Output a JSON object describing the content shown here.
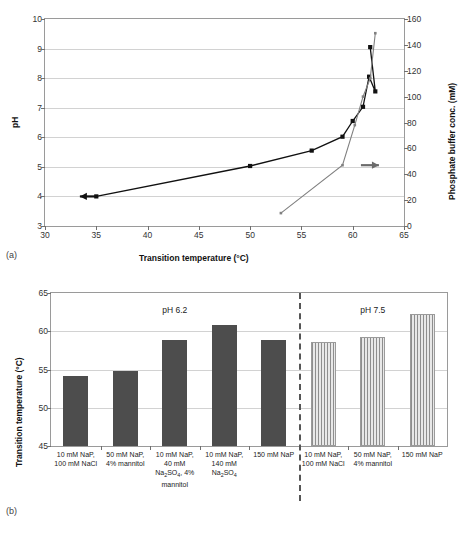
{
  "figure": {
    "panel_a_label": "(a)",
    "panel_b_label": "(b)"
  },
  "panel_a": {
    "x_axis_title": "Transition temperature (°C)",
    "y_left_title": "pH",
    "y_right_title": "Phosphate buffer conc. (mM)",
    "x_ticks": [
      "30",
      "35",
      "40",
      "45",
      "50",
      "55",
      "60",
      "65"
    ],
    "y_left_ticks": [
      "3",
      "4",
      "5",
      "6",
      "7",
      "8",
      "9",
      "10"
    ],
    "y_right_ticks": [
      "0",
      "20",
      "40",
      "60",
      "80",
      "100",
      "120",
      "140",
      "160"
    ],
    "left_arrow_icon": "left-arrow",
    "right_arrow_icon": "right-arrow"
  },
  "panel_b": {
    "y_axis_title": "Transition temperature (°C)",
    "y_ticks": [
      "45",
      "50",
      "55",
      "60",
      "65"
    ],
    "group_labels": [
      "pH 6.2",
      "pH 7.5"
    ]
  },
  "chart_data": [
    {
      "type": "line",
      "panel": "(a)",
      "title": "",
      "xlabel": "Transition temperature (°C)",
      "ylabel": "pH",
      "y2label": "Phosphate buffer conc. (mM)",
      "xlim": [
        30,
        65
      ],
      "ylim": [
        3,
        10
      ],
      "y2lim": [
        0,
        160
      ],
      "grid": true,
      "legend": "none",
      "annotations": [
        {
          "text": "left-arrow",
          "points_to": "pH series",
          "x": 33.4,
          "y": 4.0,
          "axis": "left"
        },
        {
          "text": "right-arrow",
          "points_to": "Phosphate buffer series",
          "x": 60.8,
          "y2": 47,
          "axis": "right"
        }
      ],
      "series": [
        {
          "name": "pH",
          "axis": "left",
          "color": "#111111",
          "marker": "square",
          "points": [
            {
              "x": 35.0,
              "y": 4.0
            },
            {
              "x": 50.0,
              "y": 5.03
            },
            {
              "x": 56.0,
              "y": 5.55
            },
            {
              "x": 59.0,
              "y": 6.02
            },
            {
              "x": 60.0,
              "y": 6.55
            },
            {
              "x": 61.0,
              "y": 7.03
            },
            {
              "x": 61.6,
              "y": 8.05
            },
            {
              "x": 62.2,
              "y": 7.55
            },
            {
              "x": 61.7,
              "y": 9.05
            }
          ]
        },
        {
          "name": "Phosphate buffer conc.",
          "axis": "right",
          "color": "#808080",
          "marker": "small-square",
          "points": [
            {
              "x": 53.0,
              "y2": 10
            },
            {
              "x": 59.0,
              "y2": 47
            },
            {
              "x": 60.2,
              "y2": 78
            },
            {
              "x": 61.0,
              "y2": 100
            },
            {
              "x": 61.7,
              "y2": 114
            },
            {
              "x": 62.2,
              "y2": 149
            }
          ]
        }
      ]
    },
    {
      "type": "bar",
      "panel": "(b)",
      "title": "",
      "xlabel": "",
      "ylabel": "Transition temperature (°C)",
      "ylim": [
        45,
        65
      ],
      "grid": true,
      "groups": [
        "pH 6.2",
        "pH 7.5"
      ],
      "categories": [
        "10 mM NaP, 100 mM NaCl",
        "50 mM NaP, 4% mannitol",
        "10 mM NaP, 40 mM Na2SO4, 4% mannitol",
        "10 mM NaP, 140 mM Na2SO4",
        "150 mM NaP",
        "10 mM NaP, 100 mM NaCl",
        "50 mM NaP, 4% mannitol",
        "150 mM NaP"
      ],
      "bars": [
        {
          "label_lines": [
            "10 mM NaP,",
            "100 mM NaCl"
          ],
          "value": 54.2,
          "group": "pH 6.2",
          "style": "solid"
        },
        {
          "label_lines": [
            "50 mM NaP,",
            "4% mannitol"
          ],
          "value": 54.8,
          "group": "pH 6.2",
          "style": "solid"
        },
        {
          "label_lines": [
            "10 mM NaP,",
            "40 mM",
            "Na<sub>2</sub>SO<sub>4</sub>, 4%",
            "mannitol"
          ],
          "value": 58.9,
          "group": "pH 6.2",
          "style": "solid"
        },
        {
          "label_lines": [
            "10 mM NaP,",
            "140 mM",
            "Na<sub>2</sub>SO<sub>4</sub>"
          ],
          "value": 60.8,
          "group": "pH 6.2",
          "style": "solid"
        },
        {
          "label_lines": [
            "150 mM NaP"
          ],
          "value": 58.9,
          "group": "pH 6.2",
          "style": "solid"
        },
        {
          "label_lines": [
            "10 mM NaP,",
            "100 mM NaCl"
          ],
          "value": 58.6,
          "group": "pH 7.5",
          "style": "hatch"
        },
        {
          "label_lines": [
            "50 mM NaP,",
            "4% mannitol"
          ],
          "value": 59.3,
          "group": "pH 7.5",
          "style": "hatch"
        },
        {
          "label_lines": [
            "150 mM NaP"
          ],
          "value": 62.3,
          "group": "pH 7.5",
          "style": "hatch"
        }
      ]
    }
  ]
}
